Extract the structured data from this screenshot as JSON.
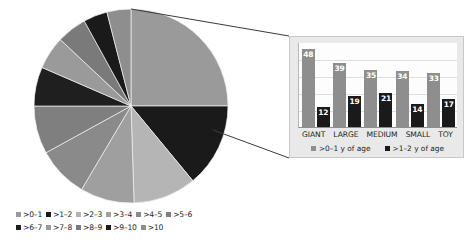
{
  "chart_data": [
    {
      "type": "pie",
      "title": "",
      "categories": [
        ">0–1",
        ">1–2",
        ">2–3",
        ">3–4",
        ">4–5",
        ">5–6",
        ">6–7",
        ">7–8",
        ">8–9",
        ">9–10",
        ">10"
      ],
      "values": [
        25.0,
        14.0,
        10.5,
        9.0,
        8.5,
        8.0,
        6.5,
        5.5,
        5.0,
        4.0,
        4.0
      ],
      "unit": "percent",
      "colors": [
        "#9a9a9a",
        "#1a1a1a",
        "#b5b5b5",
        "#9f9f9f",
        "#8a8a8a",
        "#7f7f7f",
        "#1f1f1f",
        "#9a9a9a",
        "#7a7a7a",
        "#1a1a1a",
        "#8e8e8e"
      ],
      "legend_position": "bottom",
      "start_angle": 0
    },
    {
      "type": "bar",
      "title": "",
      "categories": [
        "GIANT",
        "LARGE",
        "MEDIUM",
        "SMALL",
        "TOY"
      ],
      "series": [
        {
          "name": ">0–1 y of age",
          "values": [
            48,
            39,
            35,
            34,
            33
          ],
          "color": "#8e8e8e"
        },
        {
          "name": ">1–2 y of age",
          "values": [
            12,
            19,
            21,
            14,
            17
          ],
          "color": "#1a1a1a"
        }
      ],
      "ylim": [
        0,
        52
      ],
      "grid": true,
      "xlabel": "",
      "ylabel": "",
      "legend_position": "bottom"
    }
  ],
  "pie_legend": {
    "row1": [
      {
        "label": ">0–1",
        "color": "#9a9a9a"
      },
      {
        "label": ">1–2",
        "color": "#1a1a1a"
      },
      {
        "label": ">2–3",
        "color": "#b5b5b5"
      },
      {
        "label": ">3–4",
        "color": "#9f9f9f"
      },
      {
        "label": ">4–5",
        "color": "#8a8a8a"
      },
      {
        "label": ">5–6",
        "color": "#7f7f7f"
      }
    ],
    "row2": [
      {
        "label": ">6–7",
        "color": "#1f1f1f"
      },
      {
        "label": ">7–8",
        "color": "#9a9a9a"
      },
      {
        "label": ">8–9",
        "color": "#7a7a7a"
      },
      {
        "label": ">9–10",
        "color": "#1a1a1a"
      },
      {
        "label": ">10",
        "color": "#8e8e8e"
      }
    ]
  },
  "inset": {
    "background": "#e9e9e9",
    "plot_background": "#fdfdfd"
  }
}
